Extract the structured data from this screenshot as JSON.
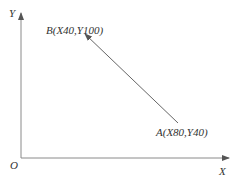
{
  "diagram": {
    "axes": {
      "x_label": "X",
      "y_label": "Y",
      "origin_label": "O"
    },
    "points": [
      {
        "id": "A",
        "label": "A(X80,Y40)",
        "x": 80,
        "y": 40
      },
      {
        "id": "B",
        "label": "B(X40,Y100)",
        "x": 40,
        "y": 100
      }
    ],
    "vector": {
      "from": "A",
      "to": "B"
    },
    "colors": {
      "axis": "#8a8a8a",
      "vector": "#666666",
      "text": "#333333"
    }
  }
}
